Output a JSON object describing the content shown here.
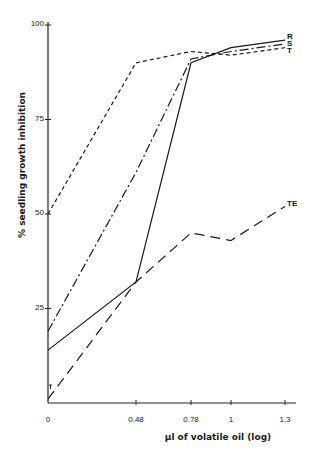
{
  "chart_data": {
    "type": "line",
    "title": "",
    "xlabel": "µl of volatile oil (log)",
    "ylabel": "% seedling growth inhibition",
    "x": [
      0,
      0.48,
      0.78,
      1,
      1.3
    ],
    "x_tick_labels": [
      "0",
      "0.48",
      "0.78",
      "1",
      "1.3"
    ],
    "y_ticks": [
      25,
      50,
      75,
      100
    ],
    "y_tick_labels": [
      "25",
      "50",
      "75",
      "100"
    ],
    "ylim": [
      0,
      100
    ],
    "grid": false,
    "series": [
      {
        "name": "R",
        "style": "solid",
        "values": [
          14,
          32,
          90,
          94,
          96
        ]
      },
      {
        "name": "S",
        "style": "dash-dot",
        "values": [
          19,
          61,
          91,
          93,
          95
        ]
      },
      {
        "name": "T",
        "style": "short-dash",
        "values": [
          50,
          90,
          93,
          92,
          94
        ]
      },
      {
        "name": "TE",
        "style": "long-dash",
        "values": [
          1,
          32,
          45,
          43,
          52
        ]
      }
    ],
    "annotations": [
      {
        "text": "R",
        "near_series": "R"
      },
      {
        "text": "S",
        "near_series": "S"
      },
      {
        "text": "T",
        "near_series": "T"
      },
      {
        "text": "TE",
        "near_series": "TE"
      }
    ],
    "legend": "inline labels at line ends"
  },
  "axis": {
    "xlabel": "µl of volatile oil (log)",
    "ylabel": "% seedling growth inhibition"
  }
}
